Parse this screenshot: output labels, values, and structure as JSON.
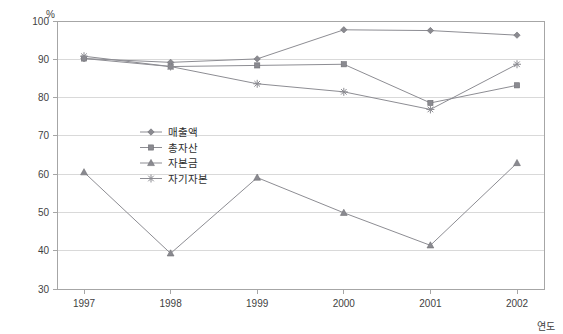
{
  "chart_data": {
    "type": "line",
    "title": "",
    "xlabel": "연도",
    "ylabel": "%",
    "ylim": [
      30,
      100
    ],
    "ytick_step": 10,
    "grid": true,
    "legend_position": "inside-center-left",
    "categories": [
      "1997",
      "1998",
      "1999",
      "2000",
      "2001",
      "2002"
    ],
    "yticks": [
      "100",
      "90",
      "80",
      "70",
      "60",
      "50",
      "40",
      "30"
    ],
    "series": [
      {
        "name": "매출액",
        "marker": "diamond",
        "values": [
          90.2,
          89.2,
          90.1,
          97.7,
          97.5,
          96.3
        ]
      },
      {
        "name": "총자산",
        "marker": "square",
        "values": [
          90.2,
          88.1,
          88.4,
          88.7,
          78.6,
          83.2
        ]
      },
      {
        "name": "자본금",
        "marker": "triangle",
        "values": [
          60.5,
          39.3,
          59.1,
          49.9,
          41.4,
          62.9
        ]
      },
      {
        "name": "자기자본",
        "marker": "star",
        "values": [
          90.8,
          88.1,
          83.6,
          81.5,
          76.9,
          88.7
        ]
      }
    ],
    "colors": {
      "line": "#8d8d93",
      "marker": "#8a8a90",
      "grid": "#d9d9d9",
      "frame": "#a6a6a6",
      "text": "#3f3f3f",
      "background": "#ffffff"
    }
  },
  "axes": {
    "y_unit_label": "%",
    "x_axis_title": "연도"
  },
  "legend": {
    "items": [
      {
        "label": "매출액"
      },
      {
        "label": "총자산"
      },
      {
        "label": "자본금"
      },
      {
        "label": "자기자본"
      }
    ]
  }
}
